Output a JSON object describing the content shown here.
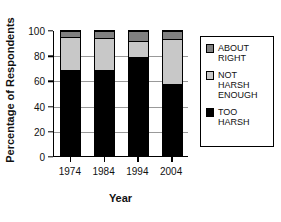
{
  "chart_data": {
    "type": "bar",
    "stacked": true,
    "title": "",
    "xlabel": "Year",
    "ylabel": "Percentage of Respondents",
    "categories": [
      "1974",
      "1984",
      "1994",
      "2004"
    ],
    "ylim": [
      0,
      100
    ],
    "yticks": [
      0,
      20,
      40,
      60,
      80,
      100
    ],
    "ytick_labels": [
      "0",
      "20",
      "40",
      "60",
      "80",
      "100"
    ],
    "grid": true,
    "legend_position": "right",
    "series": [
      {
        "name": "TOO HARSH",
        "color": "#000000",
        "values": [
          70,
          70,
          80,
          58
        ]
      },
      {
        "name": "NOT HARSH ENOUGH",
        "color": "#c8c8c8",
        "values": [
          26,
          25,
          13,
          36
        ]
      },
      {
        "name": "ABOUT RIGHT",
        "color": "#808080",
        "values": [
          4,
          5,
          7,
          6
        ]
      }
    ],
    "legend_order": [
      "ABOUT RIGHT",
      "NOT HARSH ENOUGH",
      "TOO HARSH"
    ],
    "legend_labels": [
      "ABOUT\nRIGHT",
      "NOT\nHARSH\nENOUGH",
      "TOO\nHARSH"
    ]
  }
}
